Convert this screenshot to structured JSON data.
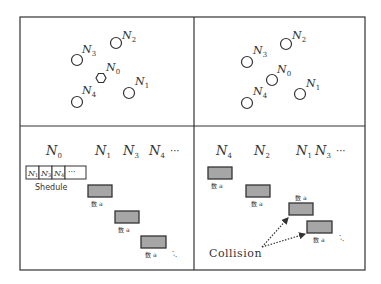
{
  "figure": {
    "frame_color": "#333333",
    "box_fill": "#a6a6a6",
    "box_stroke": "#333333"
  },
  "panels": {
    "top_left": {
      "nodes": [
        {
          "id": "N2",
          "base": "N",
          "sub": "2",
          "shape": "circle"
        },
        {
          "id": "N3",
          "base": "N",
          "sub": "3",
          "shape": "circle"
        },
        {
          "id": "N0",
          "base": "N",
          "sub": "0",
          "shape": "hexagon"
        },
        {
          "id": "N1",
          "base": "N",
          "sub": "1",
          "shape": "circle"
        },
        {
          "id": "N4",
          "base": "N",
          "sub": "4",
          "shape": "circle"
        }
      ]
    },
    "top_right": {
      "nodes": [
        {
          "id": "N2",
          "base": "N",
          "sub": "2",
          "shape": "circle"
        },
        {
          "id": "N3",
          "base": "N",
          "sub": "3",
          "shape": "circle"
        },
        {
          "id": "N0",
          "base": "N",
          "sub": "0",
          "shape": "circle"
        },
        {
          "id": "N1",
          "base": "N",
          "sub": "1",
          "shape": "circle"
        },
        {
          "id": "N4",
          "base": "N",
          "sub": "4",
          "shape": "circle"
        }
      ]
    },
    "bottom_left": {
      "header": [
        {
          "base": "N",
          "sub": "0"
        },
        {
          "base": "N",
          "sub": "1"
        },
        {
          "base": "N",
          "sub": "3"
        },
        {
          "base": "N",
          "sub": "4"
        }
      ],
      "ellipsis": "···",
      "schedule": {
        "cells": [
          {
            "base": "N",
            "sub": "1"
          },
          {
            "base": "N",
            "sub": "3"
          },
          {
            "base": "N",
            "sub": "4"
          }
        ],
        "more": "···",
        "label": "Shedule"
      },
      "data_label": "数 a",
      "trail": "·.."
    },
    "bottom_right": {
      "header": [
        {
          "base": "N",
          "sub": "4"
        },
        {
          "base": "N",
          "sub": "2"
        },
        {
          "base": "N",
          "sub": "1"
        },
        {
          "base": "N",
          "sub": "3"
        }
      ],
      "ellipsis": "···",
      "data_label": "数 a",
      "trail": "·..",
      "collision_label": "Collision"
    }
  }
}
